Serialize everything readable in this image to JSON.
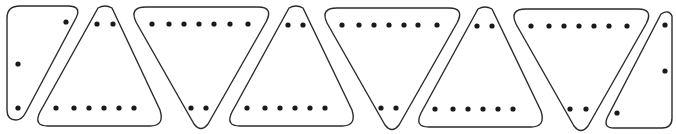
{
  "diagram": {
    "title": "",
    "colors": {
      "outline": "#2b2b2b",
      "dot": "#1a1a1a",
      "background": "#ffffff"
    },
    "pieces": [
      {
        "id": "piece-left-half",
        "kind": "half-triangle-left",
        "top_dots": 1,
        "side_dots": 1,
        "bottom_dots": 1
      },
      {
        "id": "piece-up-1",
        "kind": "triangle-up",
        "top_dots": 2,
        "bottom_dots": 6
      },
      {
        "id": "piece-down-1",
        "kind": "triangle-down",
        "top_dots": 7,
        "bottom_dots": 2
      },
      {
        "id": "piece-up-2",
        "kind": "triangle-up",
        "top_dots": 2,
        "bottom_dots": 6
      },
      {
        "id": "piece-down-2",
        "kind": "triangle-down",
        "top_dots": 7,
        "bottom_dots": 2
      },
      {
        "id": "piece-up-3",
        "kind": "triangle-up",
        "top_dots": 2,
        "bottom_dots": 6
      },
      {
        "id": "piece-down-3",
        "kind": "triangle-down",
        "top_dots": 7,
        "bottom_dots": 2
      },
      {
        "id": "piece-right-half",
        "kind": "half-triangle-right",
        "top_dots": 1,
        "side_dots": 1,
        "bottom_dots": 1
      }
    ]
  }
}
